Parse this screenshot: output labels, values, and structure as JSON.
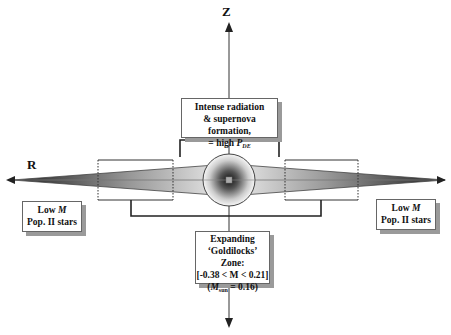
{
  "axes": {
    "z_label": "Z",
    "r_label": "R"
  },
  "boxes": {
    "top": {
      "line1": "Intense radiation",
      "line2": "& supernova formation,",
      "line3_prefix": "= high ",
      "line3_var": "P",
      "line3_sub": "DE"
    },
    "bottom": {
      "line1": "Expanding",
      "line2": "‘Goldilocks’ Zone:",
      "line3": "[-0.38 < M < 0.21]",
      "line4_open": "(",
      "line4_var": "M",
      "line4_sub": "sun",
      "line4_rest": " = 0.16)"
    },
    "left": {
      "line1_prefix": "Low ",
      "line1_var": "M",
      "line2": "Pop. II stars"
    },
    "right": {
      "line1_prefix": "Low ",
      "line1_var": "M",
      "line2": "Pop. II stars"
    }
  },
  "colors": {
    "line": "#222222",
    "shadow": "#9a9a9a",
    "disk_dark": "#333333",
    "bulge_center": "#1a1a1a"
  }
}
